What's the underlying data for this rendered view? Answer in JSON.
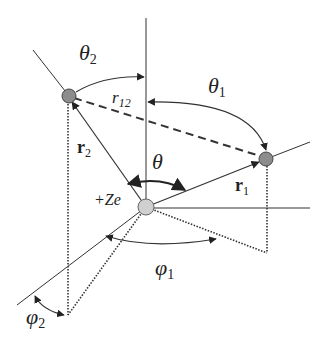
{
  "diagram": {
    "labels": {
      "theta2": "θ",
      "theta2_sub": "2",
      "theta1": "θ",
      "theta1_sub": "1",
      "theta": "θ",
      "r12": "r",
      "r12_sub": "12",
      "r2": "r",
      "r2_sub": "2",
      "r1": "r",
      "r1_sub": "1",
      "nucleus": "+Ze",
      "phi1": "φ",
      "phi1_sub": "1",
      "phi2": "φ",
      "phi2_sub": "2"
    },
    "colors": {
      "line": "#333333",
      "electron_fill": "#8c8c8c",
      "nucleus_fill": "#d0d0d0",
      "background": "#ffffff"
    }
  }
}
